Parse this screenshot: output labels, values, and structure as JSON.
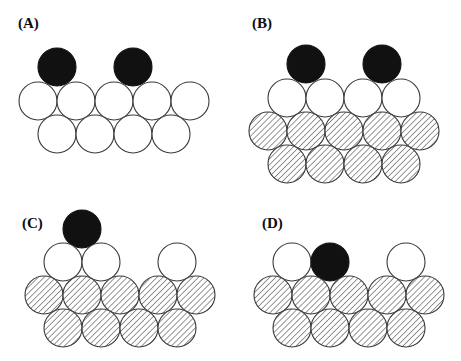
{
  "figure": {
    "width": 461,
    "height": 361,
    "background": "#ffffff"
  },
  "style": {
    "circle_diameter": 38,
    "outline_color": "#3a3a3a",
    "outline_width": 1.1,
    "black_fill": "#111111",
    "white_fill": "#ffffff",
    "hatch_fill": "#ffffff",
    "hatch_line_color": "#4a4a4a",
    "hatch_angle_deg": 45,
    "hatch_spacing": 4.2,
    "label_color": "#0d0d0d"
  },
  "legend_semantics": {
    "black_circle": "adsorbate / adatom (dark sphere)",
    "white_circle": "top-layer surface atom (open sphere)",
    "hatched_circle": "bulk substrate atom (hatched sphere)"
  },
  "panels": [
    {
      "id": "A",
      "label": "(A)",
      "label_x": 18,
      "label_y": 16,
      "origin_x": 0,
      "origin_y": 0,
      "rows": [
        {
          "name": "adatom-row",
          "kind": "black",
          "y": 67,
          "circles": [
            {
              "x": 57,
              "fill": "black"
            },
            {
              "x": 133,
              "fill": "black"
            }
          ]
        },
        {
          "name": "surface-row-1",
          "kind": "white",
          "y": 101,
          "circles": [
            {
              "x": 38,
              "fill": "white"
            },
            {
              "x": 76,
              "fill": "white"
            },
            {
              "x": 114,
              "fill": "white"
            },
            {
              "x": 152,
              "fill": "white"
            },
            {
              "x": 190,
              "fill": "white"
            }
          ]
        },
        {
          "name": "surface-row-2",
          "kind": "white",
          "y": 134,
          "circles": [
            {
              "x": 57,
              "fill": "white"
            },
            {
              "x": 95,
              "fill": "white"
            },
            {
              "x": 133,
              "fill": "white"
            },
            {
              "x": 171,
              "fill": "white"
            }
          ]
        }
      ]
    },
    {
      "id": "B",
      "label": "(B)",
      "label_x": 252,
      "label_y": 16,
      "origin_x": 0,
      "origin_y": 0,
      "rows": [
        {
          "name": "adatom-row",
          "kind": "black",
          "y": 64,
          "circles": [
            {
              "x": 306,
              "fill": "black"
            },
            {
              "x": 382,
              "fill": "black"
            }
          ]
        },
        {
          "name": "surface-row-1",
          "kind": "white",
          "y": 98,
          "circles": [
            {
              "x": 287,
              "fill": "white"
            },
            {
              "x": 325,
              "fill": "white"
            },
            {
              "x": 363,
              "fill": "white"
            },
            {
              "x": 401,
              "fill": "white"
            }
          ]
        },
        {
          "name": "substrate-row-1",
          "kind": "hatched",
          "y": 131,
          "circles": [
            {
              "x": 268,
              "fill": "hatched"
            },
            {
              "x": 306,
              "fill": "hatched"
            },
            {
              "x": 344,
              "fill": "hatched"
            },
            {
              "x": 382,
              "fill": "hatched"
            },
            {
              "x": 420,
              "fill": "hatched"
            }
          ]
        },
        {
          "name": "substrate-row-2",
          "kind": "hatched",
          "y": 164,
          "circles": [
            {
              "x": 287,
              "fill": "hatched"
            },
            {
              "x": 325,
              "fill": "hatched"
            },
            {
              "x": 363,
              "fill": "hatched"
            },
            {
              "x": 401,
              "fill": "hatched"
            }
          ]
        }
      ]
    },
    {
      "id": "C",
      "label": "(C)",
      "label_x": 22,
      "label_y": 216,
      "origin_x": 0,
      "origin_y": 0,
      "rows": [
        {
          "name": "adatom-row",
          "kind": "black",
          "y": 229,
          "circles": [
            {
              "x": 82,
              "fill": "black"
            }
          ]
        },
        {
          "name": "surface-row-1",
          "kind": "white",
          "y": 262,
          "circles": [
            {
              "x": 63,
              "fill": "white"
            },
            {
              "x": 101,
              "fill": "white"
            },
            {
              "x": 177,
              "fill": "white"
            }
          ]
        },
        {
          "name": "substrate-row-1",
          "kind": "hatched",
          "y": 295,
          "circles": [
            {
              "x": 44,
              "fill": "hatched"
            },
            {
              "x": 82,
              "fill": "hatched"
            },
            {
              "x": 120,
              "fill": "hatched"
            },
            {
              "x": 158,
              "fill": "hatched"
            },
            {
              "x": 196,
              "fill": "hatched"
            }
          ]
        },
        {
          "name": "substrate-row-2",
          "kind": "hatched",
          "y": 328,
          "circles": [
            {
              "x": 63,
              "fill": "hatched"
            },
            {
              "x": 101,
              "fill": "hatched"
            },
            {
              "x": 139,
              "fill": "hatched"
            },
            {
              "x": 177,
              "fill": "hatched"
            }
          ]
        }
      ]
    },
    {
      "id": "D",
      "label": "(D)",
      "label_x": 262,
      "label_y": 216,
      "origin_x": 0,
      "origin_y": 0,
      "rows": [
        {
          "name": "surface-row-1",
          "kind": "mixed",
          "y": 262,
          "circles": [
            {
              "x": 292,
              "fill": "white"
            },
            {
              "x": 330,
              "fill": "black"
            },
            {
              "x": 406,
              "fill": "white"
            }
          ]
        },
        {
          "name": "substrate-row-1",
          "kind": "hatched",
          "y": 295,
          "circles": [
            {
              "x": 273,
              "fill": "hatched"
            },
            {
              "x": 311,
              "fill": "hatched"
            },
            {
              "x": 349,
              "fill": "hatched"
            },
            {
              "x": 387,
              "fill": "hatched"
            },
            {
              "x": 425,
              "fill": "hatched"
            }
          ]
        },
        {
          "name": "substrate-row-2",
          "kind": "hatched",
          "y": 328,
          "circles": [
            {
              "x": 292,
              "fill": "hatched"
            },
            {
              "x": 330,
              "fill": "hatched"
            },
            {
              "x": 368,
              "fill": "hatched"
            },
            {
              "x": 406,
              "fill": "hatched"
            }
          ]
        }
      ]
    }
  ]
}
